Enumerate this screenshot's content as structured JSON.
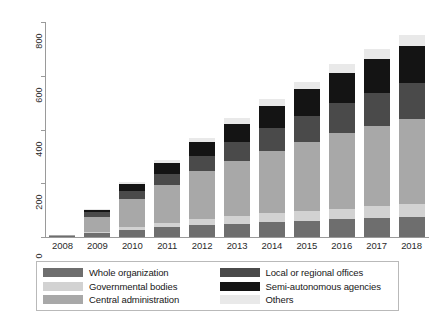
{
  "chart_data": {
    "type": "bar",
    "subtype": "stacked-bar",
    "title": "",
    "xlabel": "",
    "ylabel": "",
    "ylim": [
      0,
      800
    ],
    "yticks": [
      0,
      200,
      400,
      600,
      800
    ],
    "grid": false,
    "legend_position": "bottom",
    "categories": [
      "2008",
      "2009",
      "2010",
      "2011",
      "2012",
      "2013",
      "2014",
      "2015",
      "2016",
      "2017",
      "2018"
    ],
    "stack_order_bottom_to_top": [
      "Whole organization",
      "Governmental bodies",
      "Central administration",
      "Local or regional offices",
      "Semi-autonomous agencies",
      "Others"
    ],
    "series": [
      {
        "name": "Whole organization",
        "color": "#6e6e6e",
        "values": [
          4,
          14,
          26,
          36,
          44,
          50,
          56,
          60,
          66,
          70,
          74
        ]
      },
      {
        "name": "Governmental bodies",
        "color": "#d2d2d2",
        "values": [
          0,
          6,
          12,
          18,
          24,
          28,
          32,
          36,
          40,
          44,
          48
        ]
      },
      {
        "name": "Central administration",
        "color": "#a8a8a8",
        "values": [
          2,
          56,
          104,
          140,
          176,
          206,
          232,
          256,
          282,
          300,
          318
        ]
      },
      {
        "name": "Local or regional offices",
        "color": "#4a4a4a",
        "values": [
          0,
          16,
          28,
          42,
          56,
          70,
          84,
          98,
          110,
          122,
          132
        ]
      },
      {
        "name": "Semi-autonomous agencies",
        "color": "#141414",
        "values": [
          0,
          8,
          26,
          40,
          54,
          68,
          84,
          100,
          114,
          128,
          140
        ]
      },
      {
        "name": "Others",
        "color": "#e9e9e9",
        "values": [
          1,
          4,
          8,
          12,
          16,
          20,
          24,
          28,
          32,
          36,
          40
        ]
      }
    ],
    "totals": [
      7,
      104,
      204,
      288,
      370,
      442,
      512,
      578,
      644,
      700,
      752
    ]
  },
  "legend": {
    "items": [
      {
        "label": "Whole organization",
        "color": "#6e6e6e"
      },
      {
        "label": "Governmental bodies",
        "color": "#d2d2d2"
      },
      {
        "label": "Central administration",
        "color": "#a8a8a8"
      },
      {
        "label": "Local or regional offices",
        "color": "#4a4a4a"
      },
      {
        "label": "Semi-autonomous agencies",
        "color": "#141414"
      },
      {
        "label": "Others",
        "color": "#e9e9e9"
      }
    ],
    "order_displayed": [
      0,
      1,
      2,
      3,
      4,
      5
    ]
  }
}
